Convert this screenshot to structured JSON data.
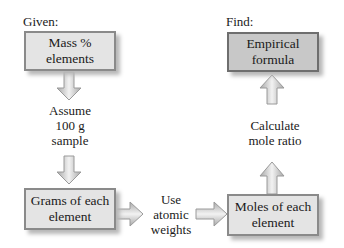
{
  "diagram": {
    "given_label": "Given:",
    "find_label": "Find:",
    "nodes": {
      "mass_percent": "Mass % elements",
      "grams": "Grams of each element",
      "moles": "Moles of each element",
      "empirical": "Empirical formula"
    },
    "steps": {
      "assume": [
        "Assume",
        "100 g",
        "sample"
      ],
      "atomic": [
        "Use",
        "atomic",
        "weights"
      ],
      "ratio": [
        "Calculate",
        "mole ratio"
      ]
    },
    "colors": {
      "box": "#e4e4e4",
      "box_dark": "#c8c8c8",
      "border": "#8a8a8a",
      "arrow": "#d0d0d0"
    }
  }
}
